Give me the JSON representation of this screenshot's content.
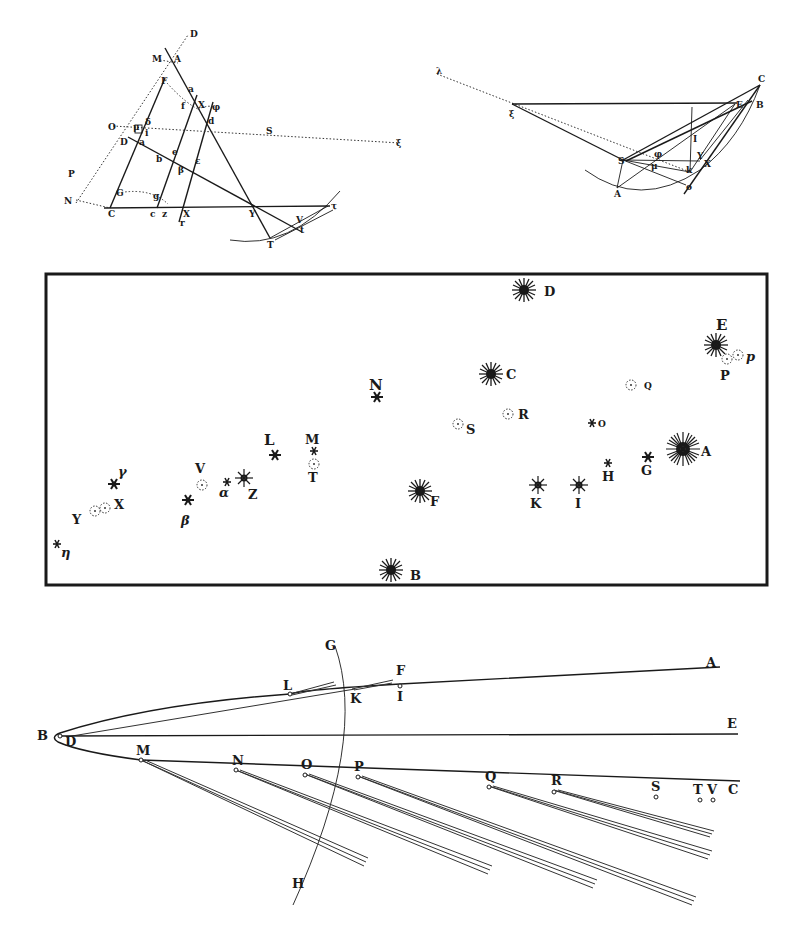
{
  "figures": {
    "fig1": {
      "title": "Construction for determining comet trajectory from three observations",
      "labels": [
        "D",
        "M",
        "A",
        "F",
        "a",
        "X",
        "φ",
        "d",
        "δ",
        "μ",
        "O",
        "λ",
        "i",
        "D",
        "E",
        "Q",
        "e",
        "b",
        "ε",
        "β",
        "P",
        "G",
        "g",
        "N",
        "C",
        "c",
        "Z",
        "X",
        "r",
        "Y",
        "V",
        "τ",
        "t",
        "T",
        "S",
        "ξ"
      ]
    },
    "fig2": {
      "title": "Orbit construction about the Sun",
      "labels": [
        "λ",
        "ξ",
        "C",
        "E",
        "B",
        "I",
        "Y",
        "X",
        "S",
        "φ",
        "μ",
        "k",
        "A",
        "o"
      ]
    },
    "fig3": {
      "title": "Star chart of comet positions",
      "stars": [
        {
          "label": "D",
          "x": 524,
          "y": 290,
          "size": "large"
        },
        {
          "label": "E",
          "x": 716,
          "y": 345,
          "size": "large"
        },
        {
          "label": "C",
          "x": 491,
          "y": 374,
          "size": "large"
        },
        {
          "label": "N",
          "x": 377,
          "y": 397,
          "size": "small"
        },
        {
          "label": "Q",
          "x": 631,
          "y": 385,
          "size": "nebula"
        },
        {
          "label": "R",
          "x": 508,
          "y": 414,
          "size": "nebula"
        },
        {
          "label": "S",
          "x": 458,
          "y": 424,
          "size": "nebula"
        },
        {
          "label": "O",
          "x": 594,
          "y": 423,
          "size": "small"
        },
        {
          "label": "A",
          "x": 683,
          "y": 450,
          "size": "xlarge"
        },
        {
          "label": "G",
          "x": 648,
          "y": 458,
          "size": "small"
        },
        {
          "label": "H",
          "x": 608,
          "y": 463,
          "size": "tiny"
        },
        {
          "label": "I",
          "x": 579,
          "y": 485,
          "size": "medium"
        },
        {
          "label": "K",
          "x": 538,
          "y": 485,
          "size": "medium"
        },
        {
          "label": "F",
          "x": 420,
          "y": 491,
          "size": "large"
        },
        {
          "label": "B",
          "x": 390,
          "y": 571,
          "size": "large"
        },
        {
          "label": "L",
          "x": 275,
          "y": 455,
          "size": "medium"
        },
        {
          "label": "M",
          "x": 313,
          "y": 452,
          "size": "tiny"
        },
        {
          "label": "T",
          "x": 313,
          "y": 464,
          "size": "nebula"
        },
        {
          "label": "Z",
          "x": 244,
          "y": 478,
          "size": "large"
        },
        {
          "label": "α",
          "x": 226,
          "y": 482,
          "size": "tiny"
        },
        {
          "label": "V",
          "x": 202,
          "y": 485,
          "size": "nebula"
        },
        {
          "label": "β",
          "x": 188,
          "y": 500,
          "size": "small"
        },
        {
          "label": "γ",
          "x": 114,
          "y": 484,
          "size": "small"
        },
        {
          "label": "X",
          "x": 104,
          "y": 508,
          "size": "nebula"
        },
        {
          "label": "Y",
          "x": 95,
          "y": 512,
          "size": "nebula"
        },
        {
          "label": "η",
          "x": 57,
          "y": 545,
          "size": "tiny"
        },
        {
          "label": "P",
          "x": 726,
          "y": 358,
          "size": "nebula"
        },
        {
          "label": "p",
          "x": 738,
          "y": 355,
          "size": "nebula"
        }
      ]
    },
    "fig4": {
      "title": "Parabolic orbit of comet with tails",
      "labels": [
        "G",
        "A",
        "F",
        "L",
        "K",
        "I",
        "B",
        "D",
        "E",
        "M",
        "N",
        "O",
        "P",
        "Q",
        "R",
        "S",
        "T",
        "V",
        "C",
        "H"
      ]
    }
  }
}
